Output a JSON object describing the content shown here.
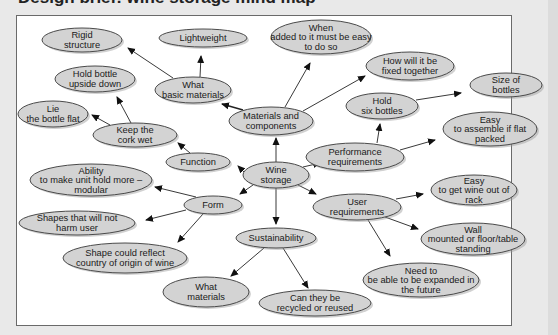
{
  "header": {
    "title_partial": "Design brief: wine storage mind map"
  },
  "diagram": {
    "type": "mind-map",
    "center_node": "wine-storage",
    "colors": {
      "node_fill": "#d3d3d3",
      "node_stroke": "#4a4a4a",
      "edge": "#222222",
      "panel_bg": "#ffffff",
      "page_bg": "#e9e9e9"
    },
    "nodes": [
      {
        "id": "wine-storage",
        "lines": [
          "Wine",
          "storage"
        ],
        "cx": 276,
        "cy": 175,
        "rx": 33,
        "ry": 13
      },
      {
        "id": "materials-components",
        "lines": [
          "Materials and",
          "components"
        ],
        "cx": 271,
        "cy": 121,
        "rx": 42,
        "ry": 14
      },
      {
        "id": "what-basic-materials",
        "lines": [
          "What",
          "basic materials"
        ],
        "cx": 193,
        "cy": 90,
        "rx": 38,
        "ry": 13
      },
      {
        "id": "rigid-structure",
        "lines": [
          "Rigid",
          "structure"
        ],
        "cx": 82,
        "cy": 40,
        "rx": 40,
        "ry": 12
      },
      {
        "id": "lightweight",
        "lines": [
          "Lightweight"
        ],
        "cx": 203,
        "cy": 38,
        "rx": 44,
        "ry": 9
      },
      {
        "id": "when-added",
        "lines": [
          "When",
          "added to it must be easy",
          "to do so"
        ],
        "cx": 321,
        "cy": 37,
        "rx": 50,
        "ry": 17
      },
      {
        "id": "how-fixed",
        "lines": [
          "How will it be",
          "fixed together"
        ],
        "cx": 410,
        "cy": 66,
        "rx": 44,
        "ry": 14
      },
      {
        "id": "performance-requirements",
        "lines": [
          "Performance",
          "requirements"
        ],
        "cx": 355,
        "cy": 157,
        "rx": 49,
        "ry": 14
      },
      {
        "id": "hold-six-bottles",
        "lines": [
          "Hold",
          "six bottles"
        ],
        "cx": 382,
        "cy": 106,
        "rx": 36,
        "ry": 13
      },
      {
        "id": "size-of-bottles",
        "lines": [
          "Size of",
          "bottles"
        ],
        "cx": 506,
        "cy": 85,
        "rx": 36,
        "ry": 12
      },
      {
        "id": "easy-assemble",
        "lines": [
          "Easy",
          "to assemble if flat",
          "packed"
        ],
        "cx": 490,
        "cy": 129,
        "rx": 47,
        "ry": 17
      },
      {
        "id": "function",
        "lines": [
          "Function"
        ],
        "cx": 198,
        "cy": 162,
        "rx": 32,
        "ry": 9
      },
      {
        "id": "keep-cork-wet",
        "lines": [
          "Keep the",
          "cork wet"
        ],
        "cx": 135,
        "cy": 135,
        "rx": 42,
        "ry": 12
      },
      {
        "id": "hold-upside-down",
        "lines": [
          "Hold bottle",
          "upside down"
        ],
        "cx": 95,
        "cy": 79,
        "rx": 40,
        "ry": 13
      },
      {
        "id": "lie-flat",
        "lines": [
          "Lie",
          "the bottle flat"
        ],
        "cx": 53,
        "cy": 114,
        "rx": 35,
        "ry": 13
      },
      {
        "id": "form",
        "lines": [
          "Form"
        ],
        "cx": 213,
        "cy": 205,
        "rx": 29,
        "ry": 9
      },
      {
        "id": "ability-modular",
        "lines": [
          "Ability",
          "to make unit hold more –",
          "modular"
        ],
        "cx": 91,
        "cy": 180,
        "rx": 61,
        "ry": 16
      },
      {
        "id": "shapes-not-harm",
        "lines": [
          "Shapes that will not",
          "harm user"
        ],
        "cx": 77,
        "cy": 223,
        "rx": 58,
        "ry": 12
      },
      {
        "id": "shape-reflect-country",
        "lines": [
          "Shape could reflect",
          "country of origin of wine"
        ],
        "cx": 125,
        "cy": 258,
        "rx": 62,
        "ry": 15
      },
      {
        "id": "sustainability",
        "lines": [
          "Sustainability"
        ],
        "cx": 276,
        "cy": 238,
        "rx": 40,
        "ry": 10
      },
      {
        "id": "what-materials",
        "lines": [
          "What",
          "materials"
        ],
        "cx": 206,
        "cy": 292,
        "rx": 43,
        "ry": 15
      },
      {
        "id": "recycled-reused",
        "lines": [
          "Can they be",
          "recycled or reused"
        ],
        "cx": 315,
        "cy": 303,
        "rx": 56,
        "ry": 13
      },
      {
        "id": "user-requirements",
        "lines": [
          "User",
          "requirements"
        ],
        "cx": 357,
        "cy": 207,
        "rx": 44,
        "ry": 13
      },
      {
        "id": "easy-get-wine",
        "lines": [
          "Easy",
          "to get wine out of",
          "rack"
        ],
        "cx": 474,
        "cy": 190,
        "rx": 43,
        "ry": 15
      },
      {
        "id": "wall-mounted",
        "lines": [
          "Wall",
          "mounted or floor/table",
          "standing"
        ],
        "cx": 473,
        "cy": 239,
        "rx": 52,
        "ry": 16
      },
      {
        "id": "need-expanded",
        "lines": [
          "Need to",
          "be able to be expanded in",
          "the future"
        ],
        "cx": 421,
        "cy": 280,
        "rx": 58,
        "ry": 17
      }
    ],
    "edges": [
      {
        "from": "wine-storage",
        "to": "materials-components",
        "x1": 276,
        "y1": 162,
        "x2": 276,
        "y2": 138
      },
      {
        "from": "wine-storage",
        "to": "performance-requirements",
        "x1": 303,
        "y1": 167,
        "x2": 320,
        "y2": 163
      },
      {
        "from": "wine-storage",
        "to": "function",
        "x1": 244,
        "y1": 172,
        "x2": 238,
        "y2": 166
      },
      {
        "from": "wine-storage",
        "to": "form",
        "x1": 253,
        "y1": 185,
        "x2": 240,
        "y2": 194
      },
      {
        "from": "wine-storage",
        "to": "sustainability",
        "x1": 276,
        "y1": 188,
        "x2": 276,
        "y2": 224
      },
      {
        "from": "wine-storage",
        "to": "user-requirements",
        "x1": 298,
        "y1": 185,
        "x2": 316,
        "y2": 194
      },
      {
        "from": "materials-components",
        "to": "what-basic-materials",
        "x1": 243,
        "y1": 110,
        "x2": 222,
        "y2": 104,
        "thick": true
      },
      {
        "from": "materials-components",
        "to": "when-added",
        "x1": 285,
        "y1": 107,
        "x2": 310,
        "y2": 63
      },
      {
        "from": "materials-components",
        "to": "how-fixed",
        "x1": 303,
        "y1": 111,
        "x2": 365,
        "y2": 76
      },
      {
        "from": "what-basic-materials",
        "to": "rigid-structure",
        "x1": 173,
        "y1": 78,
        "x2": 128,
        "y2": 48
      },
      {
        "from": "what-basic-materials",
        "to": "lightweight",
        "x1": 200,
        "y1": 77,
        "x2": 201,
        "y2": 56
      },
      {
        "from": "performance-requirements",
        "to": "hold-six-bottles",
        "x1": 377,
        "y1": 143,
        "x2": 380,
        "y2": 124
      },
      {
        "from": "performance-requirements",
        "to": "easy-assemble",
        "x1": 400,
        "y1": 150,
        "x2": 435,
        "y2": 140
      },
      {
        "from": "hold-six-bottles",
        "to": "size-of-bottles",
        "x1": 416,
        "y1": 100,
        "x2": 461,
        "y2": 93
      },
      {
        "from": "function",
        "to": "keep-cork-wet",
        "x1": 190,
        "y1": 153,
        "x2": 178,
        "y2": 143
      },
      {
        "from": "keep-cork-wet",
        "to": "hold-upside-down",
        "x1": 131,
        "y1": 123,
        "x2": 117,
        "y2": 97
      },
      {
        "from": "keep-cork-wet",
        "to": "lie-flat",
        "x1": 110,
        "y1": 125,
        "x2": 92,
        "y2": 115
      },
      {
        "from": "form",
        "to": "ability-modular",
        "x1": 196,
        "y1": 197,
        "x2": 155,
        "y2": 187
      },
      {
        "from": "form",
        "to": "shapes-not-harm",
        "x1": 186,
        "y1": 210,
        "x2": 146,
        "y2": 220
      },
      {
        "from": "form",
        "to": "shape-reflect-country",
        "x1": 203,
        "y1": 214,
        "x2": 178,
        "y2": 242
      },
      {
        "from": "sustainability",
        "to": "what-materials",
        "x1": 264,
        "y1": 248,
        "x2": 231,
        "y2": 276
      },
      {
        "from": "sustainability",
        "to": "recycled-reused",
        "x1": 283,
        "y1": 248,
        "x2": 308,
        "y2": 288
      },
      {
        "from": "user-requirements",
        "to": "easy-get-wine",
        "x1": 396,
        "y1": 199,
        "x2": 423,
        "y2": 194
      },
      {
        "from": "user-requirements",
        "to": "wall-mounted",
        "x1": 385,
        "y1": 217,
        "x2": 418,
        "y2": 229
      },
      {
        "from": "user-requirements",
        "to": "need-expanded",
        "x1": 368,
        "y1": 220,
        "x2": 390,
        "y2": 256
      }
    ]
  }
}
